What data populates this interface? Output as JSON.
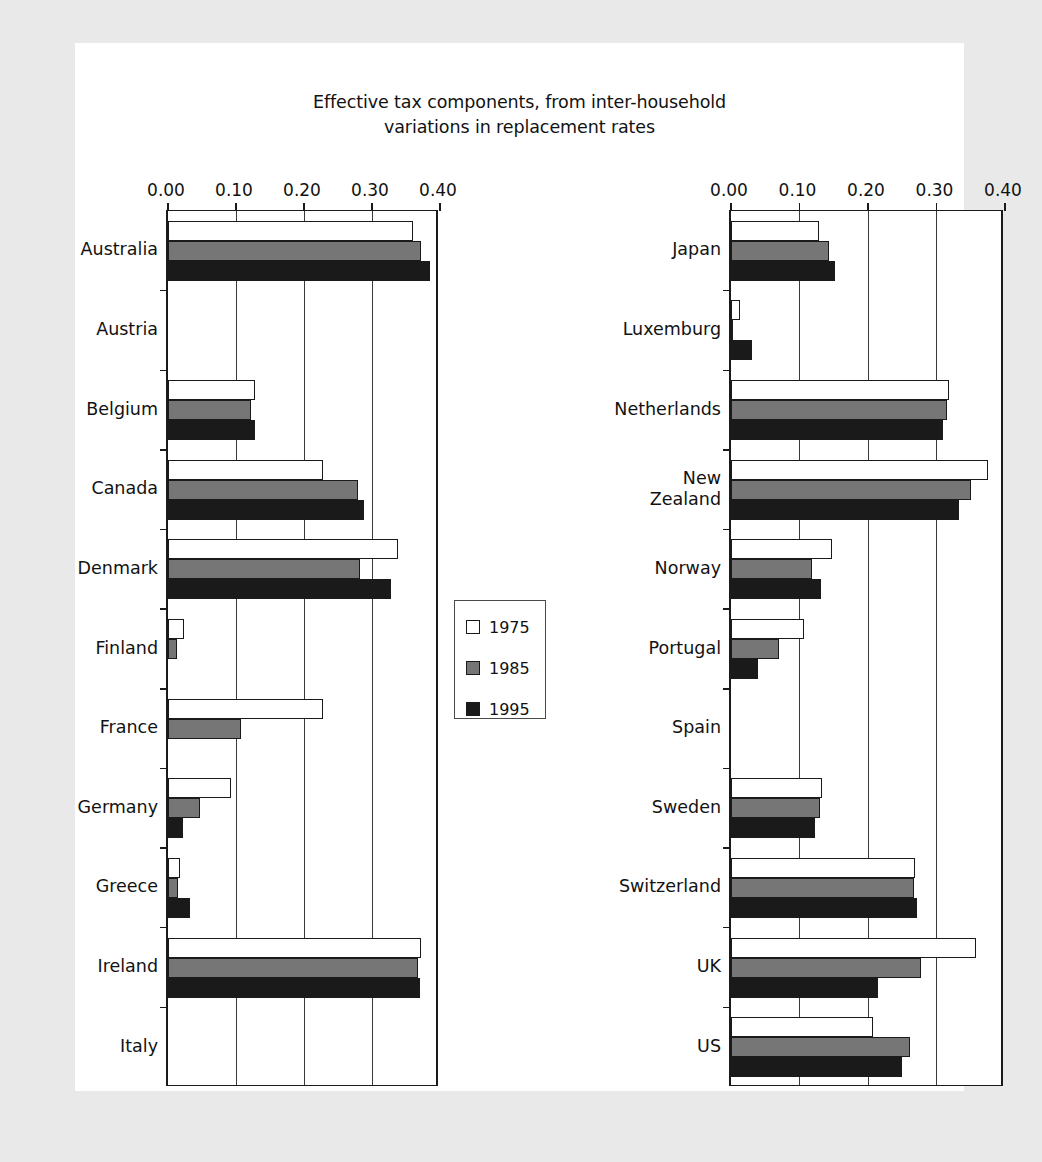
{
  "chart_data": {
    "type": "bar",
    "orientation": "horizontal",
    "title": "Effective tax components, from inter-household variations in replacement rates",
    "title_lines": [
      "Effective tax components, from inter-household",
      "variations in replacement rates"
    ],
    "xlabel": "",
    "ylabel": "",
    "xlim": [
      0.0,
      0.4
    ],
    "xticks": [
      0.0,
      0.1,
      0.2,
      0.3,
      0.4
    ],
    "xtick_labels": [
      "0.00",
      "0.10",
      "0.20",
      "0.30",
      "0.40"
    ],
    "grid": true,
    "grid_axis": "x",
    "legend": {
      "position": "center",
      "entries": [
        {
          "label": "1975",
          "color": "#ffffff"
        },
        {
          "label": "1985",
          "color": "#767676"
        },
        {
          "label": "1995",
          "color": "#1a1a1a"
        }
      ]
    },
    "series": [
      {
        "name": "1975",
        "color": "#ffffff"
      },
      {
        "name": "1985",
        "color": "#767676"
      },
      {
        "name": "1995",
        "color": "#1a1a1a"
      }
    ],
    "panels": [
      {
        "id": "panel-left",
        "categories": [
          "Australia",
          "Austria",
          "Belgium",
          "Canada",
          "Denmark",
          "Finland",
          "France",
          "Germany",
          "Greece",
          "Ireland",
          "Italy"
        ],
        "values": {
          "1975": [
            0.361,
            0.0,
            0.128,
            0.228,
            0.338,
            0.024,
            0.228,
            0.092,
            0.018,
            0.372,
            0.0
          ],
          "1985": [
            0.372,
            0.0,
            0.122,
            0.28,
            0.282,
            0.013,
            0.108,
            0.047,
            0.015,
            0.367,
            0.0
          ],
          "1995": [
            0.386,
            0.0,
            0.128,
            0.288,
            0.328,
            0.0,
            0.0,
            0.022,
            0.032,
            0.37,
            0.0
          ]
        }
      },
      {
        "id": "panel-right",
        "categories": [
          "Japan",
          "Luxemburg",
          "Netherlands",
          "New\nZealand",
          "Norway",
          "Portugal",
          "Spain",
          "Sweden",
          "Switzerland",
          "UK",
          "US"
        ],
        "values": {
          "1975": [
            0.128,
            0.013,
            0.318,
            0.375,
            0.147,
            0.107,
            0.0,
            0.133,
            0.268,
            0.357,
            0.207
          ],
          "1985": [
            0.143,
            0.003,
            0.316,
            0.35,
            0.118,
            0.07,
            0.0,
            0.13,
            0.267,
            0.278,
            0.262
          ],
          "1995": [
            0.152,
            0.03,
            0.31,
            0.333,
            0.132,
            0.04,
            0.0,
            0.122,
            0.272,
            0.215,
            0.25
          ]
        }
      }
    ]
  },
  "colors": {
    "page_background": "#e9e9e9",
    "paper": "#ffffff",
    "ink": "#121212",
    "axis": "#1a1a1a",
    "grid": "#3a3a3a",
    "bar_1975": "#ffffff",
    "bar_1985": "#767676",
    "bar_1995": "#1a1a1a"
  }
}
